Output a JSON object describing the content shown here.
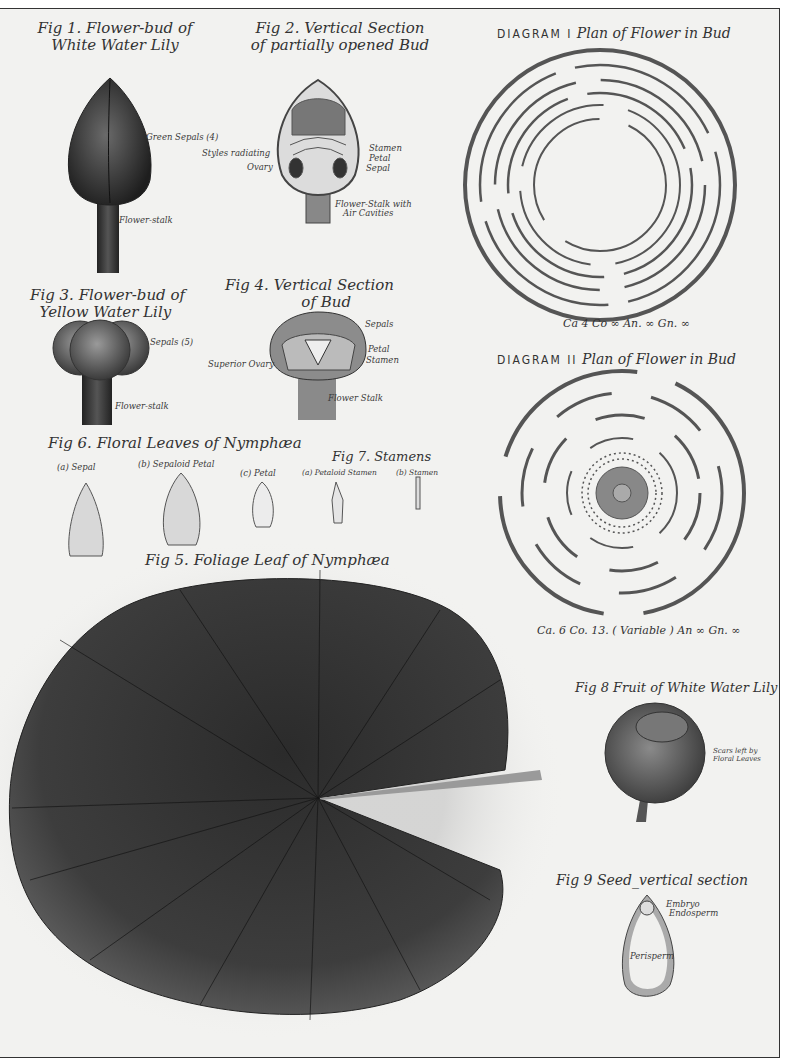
{
  "plate": {
    "figures": {
      "fig1": {
        "title_line1": "Fig 1. Flower-bud of",
        "title_line2": "White Water Lily",
        "labels": {
          "sepals": "Green Sepals (4)",
          "stalk": "Flower-stalk"
        }
      },
      "fig2": {
        "title_line1": "Fig 2. Vertical Section",
        "title_line2": "of partially opened Bud",
        "labels": {
          "styles": "Styles radiating",
          "ovary": "Ovary",
          "stamen": "Stamen",
          "petal": "Petal",
          "sepal": "Sepal",
          "stalk_line1": "Flower-Stalk with",
          "stalk_line2": "Air Cavities"
        }
      },
      "fig3": {
        "title_line1": "Fig 3. Flower-bud of",
        "title_line2": "Yellow Water Lily",
        "labels": {
          "sepals": "Sepals (5)",
          "stalk": "Flower-stalk"
        }
      },
      "fig4": {
        "title_line1": "Fig 4. Vertical Section",
        "title_line2": "of Bud",
        "labels": {
          "sepals": "Sepals",
          "petal": "Petal",
          "stamen": "Stamen",
          "ovary": "Superior Ovary",
          "stalk": "Flower Stalk"
        }
      },
      "fig5": {
        "title": "Fig 5. Foliage Leaf of Nymphæa"
      },
      "fig6": {
        "title": "Fig 6. Floral Leaves of Nymphæa",
        "labels": {
          "a": "(a) Sepal",
          "b": "(b) Sepaloid Petal",
          "c": "(c) Petal"
        }
      },
      "fig7": {
        "title": "Fig 7. Stamens",
        "labels": {
          "a": "(a) Petaloid Stamen",
          "b": "(b) Stamen"
        }
      },
      "fig8": {
        "title": "Fig 8 Fruit of White Water Lily",
        "labels": {
          "scars_line1": "Scars left by",
          "scars_line2": "Floral Leaves"
        }
      },
      "fig9": {
        "title": "Fig 9 Seed_vertical section",
        "labels": {
          "embryo": "Embryo",
          "endosperm": "Endosperm",
          "perisperm": "Perisperm"
        }
      }
    },
    "diagrams": {
      "d1": {
        "prefix": "DIAGRAM I",
        "title": "Plan of Flower in Bud",
        "formula": "Ca 4  Co ∞ An. ∞   Gn. ∞"
      },
      "d2": {
        "prefix": "DIAGRAM II",
        "title": "Plan of Flower in Bud",
        "formula": "Ca. 6  Co. 13. ( Variable ) An ∞    Gn. ∞"
      }
    }
  }
}
